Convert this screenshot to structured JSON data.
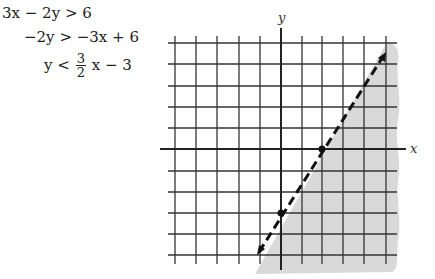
{
  "equations": {
    "line1": {
      "lhs": "3x − 2y",
      "op": ">",
      "rhs": "6"
    },
    "line2": {
      "lhs": "−2y",
      "op": ">",
      "rhs": "−3x + 6"
    },
    "line3": {
      "lhs": "y",
      "op": "<",
      "num": "3",
      "den": "2",
      "rest": "x − 3"
    }
  },
  "graph": {
    "x_axis_label": "x",
    "y_axis_label": "y",
    "boundary": "dashed",
    "boundary_equation": "y = (3/2)x − 3",
    "points": [
      {
        "label": "x-intercept",
        "x": 2,
        "y": 0
      },
      {
        "label": "y-intercept",
        "x": 0,
        "y": -3
      }
    ],
    "shaded_region": "below/right of line (y < 3/2 x − 3)",
    "grid_x_range": [
      -5,
      5
    ],
    "grid_y_range": [
      -5,
      5
    ],
    "colors": {
      "shade": "#d9d9d9",
      "grid": "#333333",
      "line": "#111111"
    }
  }
}
